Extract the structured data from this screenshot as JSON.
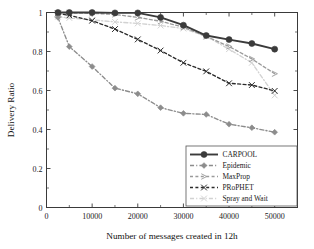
{
  "chart_data": {
    "type": "line",
    "title": "",
    "xlabel": "Number of messages created in 12h",
    "ylabel": "Delivery Ratio",
    "xlim": [
      0,
      55000
    ],
    "ylim": [
      0,
      1
    ],
    "xticks": [
      0,
      10000,
      20000,
      30000,
      40000,
      50000
    ],
    "xticklabels": [
      "0",
      "10000",
      "20000",
      "30000",
      "40000",
      "50000"
    ],
    "yticks": [
      0,
      0.2,
      0.4,
      0.6,
      0.8,
      1
    ],
    "yticklabels": [
      "0",
      "0.2",
      "0.4",
      "0.6",
      "0.8",
      "1"
    ],
    "grid": false,
    "legend_position": "lower right",
    "x": [
      2500,
      5000,
      10000,
      15000,
      20000,
      25000,
      30000,
      35000,
      40000,
      45000,
      50000
    ],
    "series": [
      {
        "name": "CARPOOL",
        "color": "#3b3b3b",
        "marker": "circle",
        "linestyle": "solid",
        "values": [
          1.0,
          1.0,
          1.0,
          0.998,
          0.998,
          0.975,
          0.935,
          0.882,
          0.861,
          0.841,
          0.812
        ]
      },
      {
        "name": "Epidemic",
        "color": "#8c8c8c",
        "marker": "diamond",
        "linestyle": "dashdot",
        "values": [
          0.975,
          0.825,
          0.723,
          0.612,
          0.583,
          0.512,
          0.483,
          0.477,
          0.427,
          0.409,
          0.386
        ]
      },
      {
        "name": "MaxProp",
        "color": "#9a9a9a",
        "marker": "tri-right",
        "linestyle": "dashed",
        "values": [
          1.0,
          0.998,
          0.996,
          0.99,
          0.975,
          0.955,
          0.925,
          0.877,
          0.826,
          0.762,
          0.686
        ]
      },
      {
        "name": "PRoPHET",
        "color": "#2a2a2a",
        "marker": "x",
        "linestyle": "dashed",
        "values": [
          0.995,
          0.985,
          0.958,
          0.915,
          0.862,
          0.805,
          0.742,
          0.698,
          0.637,
          0.628,
          0.598
        ]
      },
      {
        "name": "Spray and Wait",
        "color": "#d2d2d2",
        "marker": "x",
        "linestyle": "dashdot",
        "values": [
          0.978,
          0.972,
          0.962,
          0.952,
          0.944,
          0.933,
          0.918,
          0.878,
          0.812,
          0.742,
          0.575
        ]
      }
    ]
  },
  "legend": {
    "entries": [
      {
        "label": "CARPOOL"
      },
      {
        "label": "Epidemic"
      },
      {
        "label": "MaxProp"
      },
      {
        "label": "PRoPHET"
      },
      {
        "label": "Spray and Wait"
      }
    ]
  }
}
